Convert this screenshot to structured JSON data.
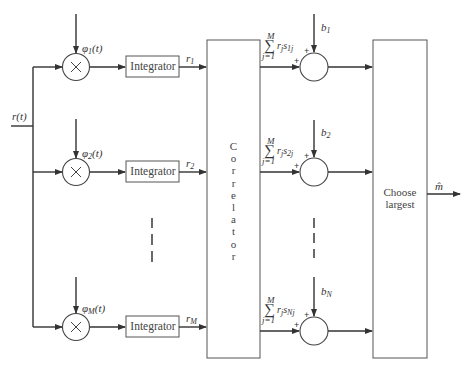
{
  "diagram": {
    "input_label": "r(t)",
    "output_label": "m̂",
    "branches": [
      {
        "basis": "φ",
        "basis_sub": "1",
        "basis_arg": "(t)",
        "integrator": "Integrator",
        "output": "r",
        "output_sub": "1"
      },
      {
        "basis": "φ",
        "basis_sub": "2",
        "basis_arg": "(t)",
        "integrator": "Integrator",
        "output": "r",
        "output_sub": "2"
      },
      {
        "basis": "φ",
        "basis_sub": "M",
        "basis_arg": "(t)",
        "integrator": "Integrator",
        "output": "r",
        "output_sub": "M"
      }
    ],
    "correlator": {
      "label_letters": [
        "C",
        "o",
        "r",
        "r",
        "e",
        "l",
        "a",
        "t",
        "o",
        "r"
      ]
    },
    "correlator_outputs": [
      {
        "sum_upper": "M",
        "sum_lower": "j=1",
        "term": "r",
        "term_sub": "j",
        "s": "s",
        "s_sub": "1j",
        "bias": "b",
        "bias_sub": "1",
        "plus_top": "+",
        "plus_left": "+"
      },
      {
        "sum_upper": "M",
        "sum_lower": "j=1",
        "term": "r",
        "term_sub": "j",
        "s": "s",
        "s_sub": "2j",
        "bias": "b",
        "bias_sub": "2",
        "plus_top": "+",
        "plus_left": "+"
      },
      {
        "sum_upper": "M",
        "sum_lower": "j=1",
        "term": "r",
        "term_sub": "j",
        "s": "s",
        "s_sub": "Nj",
        "bias": "b",
        "bias_sub": "N",
        "plus_top": "+",
        "plus_left": "+"
      }
    ],
    "decision": {
      "line1": "Choose",
      "line2": "largest"
    },
    "multiplier_symbol": "×",
    "colors": {
      "line": "#333333",
      "box": "#555555",
      "background": "#ffffff"
    }
  }
}
